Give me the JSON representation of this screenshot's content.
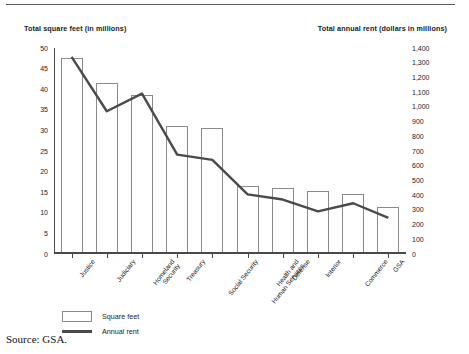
{
  "figure": {
    "top_rule": true,
    "source_note": "Source: GSA."
  },
  "chart_data": {
    "type": "bar",
    "title": "",
    "subtitle": "",
    "xlabel": "",
    "ylabel": "Total square feet (in millions)",
    "y2label": "Total annual rent (dollars in millions)",
    "grid": false,
    "legend_position": "bottom-left",
    "categories": [
      "Justice",
      "Judiciary",
      "Homeland Security",
      "Treasury",
      "Social Security",
      "Health and Human Services",
      "Defense",
      "Interior",
      "Commerce",
      "GSA"
    ],
    "ylim": [
      0,
      50
    ],
    "yticks": [
      "0",
      "5",
      "10",
      "15",
      "20",
      "25",
      "30",
      "35",
      "40",
      "45",
      "50"
    ],
    "y2lim": [
      0,
      1400
    ],
    "y2ticks": [
      "0",
      "100",
      "200",
      "300",
      "400",
      "500",
      "600",
      "700",
      "800",
      "900",
      "1,000",
      "1,100",
      "1,200",
      "1,300",
      "1,400"
    ],
    "series": [
      {
        "name": "Square feet",
        "axis": "left",
        "render": "bar",
        "values": [
          47.5,
          41.5,
          38.5,
          31.0,
          30.5,
          16.5,
          16.0,
          15.3,
          14.5,
          11.3
        ]
      },
      {
        "name": "Annual rent",
        "axis": "right",
        "render": "line",
        "values": [
          1340,
          970,
          1090,
          675,
          640,
          405,
          370,
          290,
          345,
          245
        ]
      }
    ]
  },
  "legend": {
    "items": [
      {
        "label": "Square feet",
        "marker": "box"
      },
      {
        "label": "Annual rent",
        "marker": "line"
      }
    ]
  }
}
